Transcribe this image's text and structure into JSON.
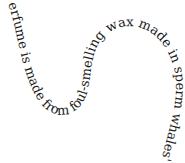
{
  "curved_text": {
    "content": "erfume is made from foul-smelling wax made in sperm whales' guts.",
    "color": "#1a1a1a"
  }
}
